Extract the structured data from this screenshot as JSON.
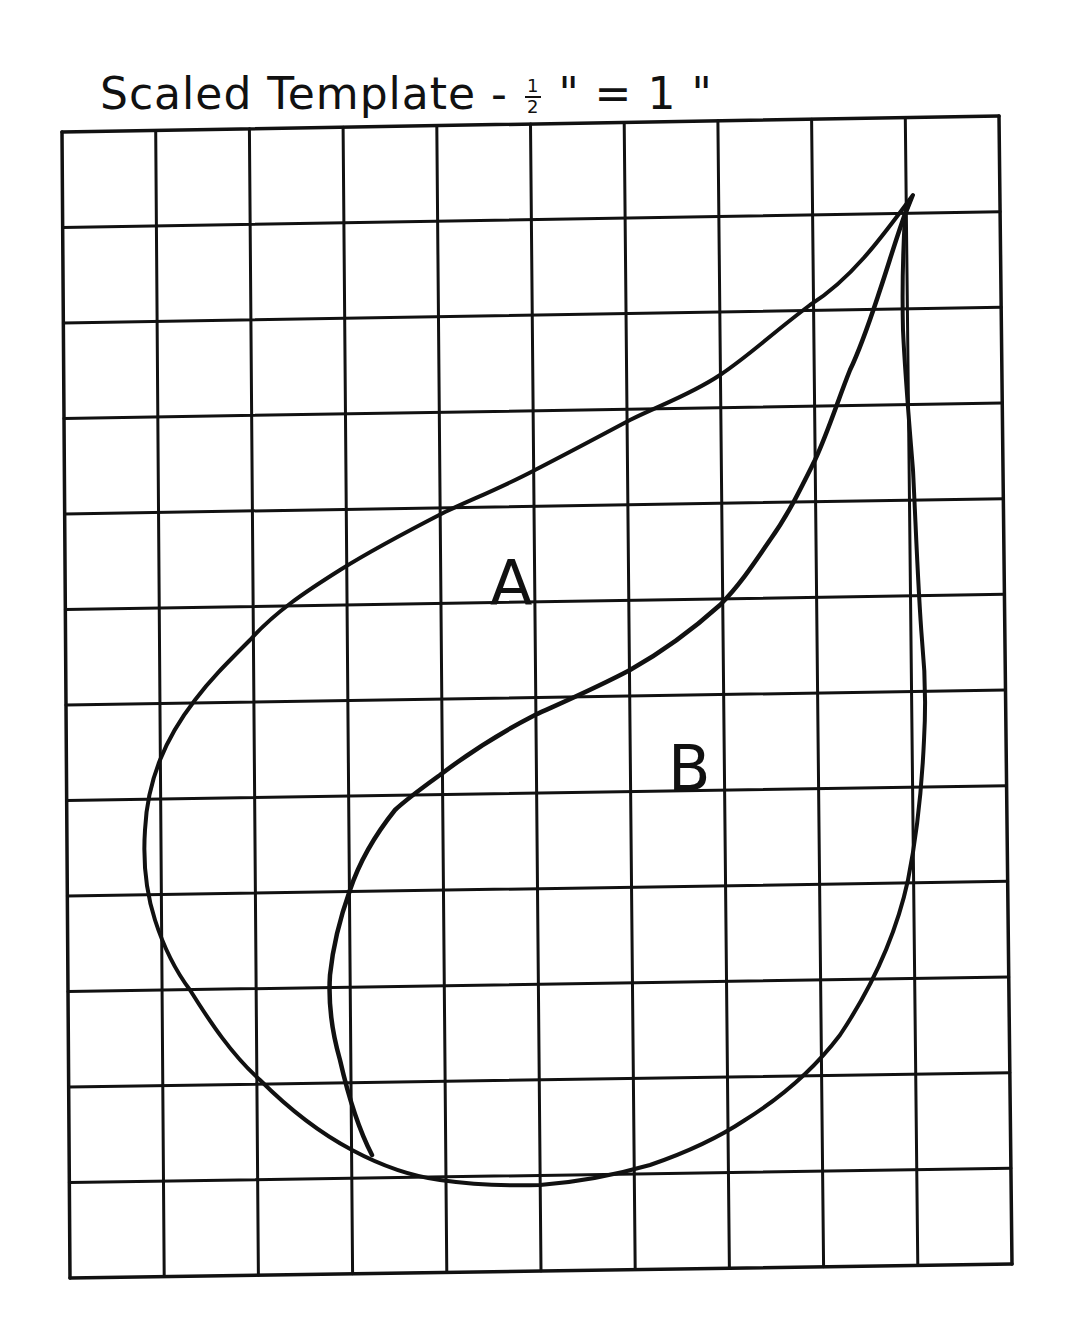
{
  "title": {
    "main": "Scaled Template -",
    "scale_numerator": "1",
    "scale_denominator": "2",
    "scale_rest": "\" = 1 \""
  },
  "grid": {
    "columns": 10,
    "rows": 12,
    "corners": {
      "top_left": [
        62,
        132
      ],
      "top_right": [
        999,
        116
      ],
      "bottom_left": [
        70,
        1278
      ],
      "bottom_right": [
        1012,
        1264
      ]
    },
    "line_color": "#111111"
  },
  "shapes": {
    "outer_curve": {
      "name": "Piece A outer boundary (teardrop / paisley)",
      "stroke": "#111111"
    },
    "inner_curve": {
      "name": "Piece B dividing curve",
      "stroke": "#111111"
    }
  },
  "labels": {
    "a": "A",
    "b": "B"
  }
}
